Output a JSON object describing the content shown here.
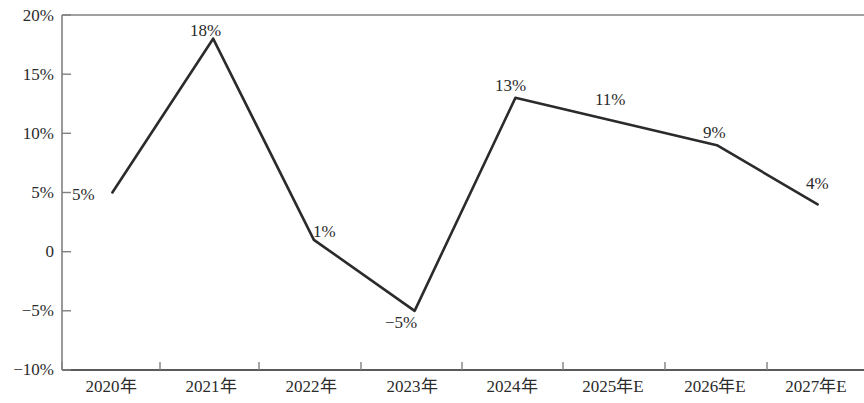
{
  "chart_data": {
    "type": "line",
    "title": "",
    "xlabel": "",
    "ylabel": "",
    "categories": [
      "2020年",
      "2021年",
      "2022年",
      "2023年",
      "2024年",
      "2025年E",
      "2026年E",
      "2027年E"
    ],
    "values": [
      5,
      18,
      1,
      -5,
      13,
      11,
      9,
      4
    ],
    "point_labels": [
      "5%",
      "18%",
      "1%",
      "−5%",
      "13%",
      "11%",
      "9%",
      "4%"
    ],
    "series": [
      {
        "name": "",
        "values": [
          5,
          18,
          1,
          -5,
          13,
          11,
          9,
          4
        ]
      }
    ],
    "ylim": [
      -10,
      20
    ],
    "y_ticks": [
      20,
      15,
      10,
      5,
      0,
      -5,
      -10
    ],
    "y_tick_labels": [
      "20%",
      "15%",
      "10%",
      "5%",
      "0",
      "−5%",
      "−10%"
    ],
    "grid": false,
    "legend": false,
    "legend_position": "none",
    "line_color": "#2b2b2b",
    "axis_color": "#6b6b6b",
    "text_color": "#2b2b2b",
    "background_color": "#ffffff",
    "units": "percent"
  },
  "axes": {
    "y_labels": [
      "20%",
      "15%",
      "10%",
      "5%",
      "0",
      "−5%",
      "−10%"
    ],
    "x_labels": [
      "2020年",
      "2021年",
      "2022年",
      "2023年",
      "2024年",
      "2025年E",
      "2026年E",
      "2027年E"
    ]
  },
  "labels": {
    "points": [
      "5%",
      "18%",
      "1%",
      "−5%",
      "13%",
      "11%",
      "9%",
      "4%"
    ]
  }
}
